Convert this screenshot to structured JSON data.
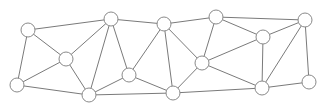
{
  "graph": {
    "style": {
      "edge_color": "#7a7a7a",
      "node_stroke": "#8a8a8a",
      "node_fill": "#ffffff",
      "node_radius": 7
    },
    "nodes": [
      {
        "id": "n1",
        "x": 28,
        "y": 30
      },
      {
        "id": "n2",
        "x": 66,
        "y": 59
      },
      {
        "id": "n3",
        "x": 17,
        "y": 85
      },
      {
        "id": "n4",
        "x": 111,
        "y": 19
      },
      {
        "id": "n5",
        "x": 129,
        "y": 75
      },
      {
        "id": "n6",
        "x": 89,
        "y": 95
      },
      {
        "id": "n7",
        "x": 164,
        "y": 24
      },
      {
        "id": "n8",
        "x": 216,
        "y": 17
      },
      {
        "id": "n9",
        "x": 202,
        "y": 63
      },
      {
        "id": "n10",
        "x": 173,
        "y": 93
      },
      {
        "id": "n11",
        "x": 263,
        "y": 37
      },
      {
        "id": "n12",
        "x": 305,
        "y": 20
      },
      {
        "id": "n13",
        "x": 262,
        "y": 88
      },
      {
        "id": "n14",
        "x": 309,
        "y": 82
      }
    ],
    "edges": [
      [
        "n1",
        "n4"
      ],
      [
        "n1",
        "n2"
      ],
      [
        "n1",
        "n3"
      ],
      [
        "n2",
        "n3"
      ],
      [
        "n2",
        "n4"
      ],
      [
        "n2",
        "n6"
      ],
      [
        "n3",
        "n6"
      ],
      [
        "n4",
        "n7"
      ],
      [
        "n4",
        "n6"
      ],
      [
        "n4",
        "n5"
      ],
      [
        "n5",
        "n6"
      ],
      [
        "n5",
        "n7"
      ],
      [
        "n5",
        "n10"
      ],
      [
        "n6",
        "n10"
      ],
      [
        "n7",
        "n8"
      ],
      [
        "n7",
        "n9"
      ],
      [
        "n7",
        "n10"
      ],
      [
        "n8",
        "n11"
      ],
      [
        "n8",
        "n12"
      ],
      [
        "n8",
        "n9"
      ],
      [
        "n9",
        "n10"
      ],
      [
        "n9",
        "n11"
      ],
      [
        "n9",
        "n13"
      ],
      [
        "n10",
        "n13"
      ],
      [
        "n11",
        "n12"
      ],
      [
        "n11",
        "n13"
      ],
      [
        "n12",
        "n13"
      ],
      [
        "n12",
        "n14"
      ],
      [
        "n13",
        "n14"
      ]
    ]
  }
}
